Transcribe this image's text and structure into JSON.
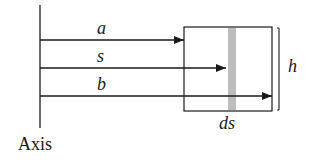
{
  "diagram": {
    "axis_label": "Axis",
    "arrows": [
      {
        "label": "a",
        "y": 40,
        "end_x": 184
      },
      {
        "label": "s",
        "y": 68,
        "end_x": 226
      },
      {
        "label": "b",
        "y": 96,
        "end_x": 272
      }
    ],
    "box_height_label": "h",
    "strip_width_label": "ds",
    "colors": {
      "line": "#1a1a1a",
      "strip": "#bdbdbd"
    }
  }
}
